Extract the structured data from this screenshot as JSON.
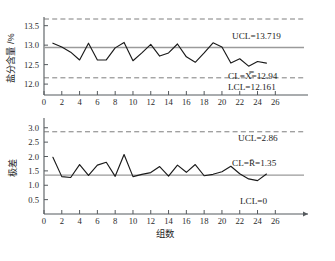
{
  "figure": {
    "background": "#ffffff",
    "line_color": "#1a1a1a",
    "center_line_color": "#9a9a9a",
    "limit_line_color": "#6f6f6f"
  },
  "chart_data": [
    {
      "type": "line",
      "name": "xbar-chart",
      "title": "",
      "xlabel": "",
      "ylabel": "盐分含量 /%",
      "xlim": [
        0,
        27.2
      ],
      "ylim": [
        11.72,
        13.62
      ],
      "grid": false,
      "legend": "none",
      "xticks": [
        0,
        2,
        4,
        6,
        8,
        10,
        12,
        14,
        16,
        18,
        20,
        22,
        24,
        26
      ],
      "xticklabels": [
        "0",
        "2",
        "4",
        "6",
        "8",
        "10",
        "12",
        "14",
        "16",
        "18",
        "20",
        "22",
        "24",
        "26"
      ],
      "yticks": [
        12.0,
        12.5,
        13.0,
        13.5
      ],
      "yticklabels": [
        "12.0",
        "12.5",
        "13.0",
        "13.5"
      ],
      "x": [
        1,
        2,
        3,
        4,
        5,
        6,
        7,
        8,
        9,
        10,
        11,
        12,
        13,
        14,
        15,
        16,
        17,
        18,
        19,
        20,
        21,
        22,
        23,
        24,
        25
      ],
      "values": [
        13.05,
        12.95,
        12.82,
        12.62,
        13.05,
        12.62,
        12.62,
        12.93,
        13.07,
        12.6,
        12.8,
        13.02,
        12.72,
        12.8,
        13.03,
        12.7,
        12.56,
        12.8,
        13.06,
        12.95,
        12.54,
        12.65,
        12.46,
        12.58,
        12.54
      ],
      "control_lines": [
        {
          "label": "UCL",
          "value": 13.719,
          "text": "UCL=13.719",
          "style": "dashed"
        },
        {
          "label": "CL",
          "value": 12.94,
          "text": "CL=X̿=12.94",
          "style": "solid"
        },
        {
          "label": "LCL",
          "value": 12.161,
          "text": "LCL=12.161",
          "style": "dashed"
        }
      ]
    },
    {
      "type": "line",
      "name": "range-chart",
      "title": "",
      "xlabel": "组数",
      "ylabel": "极差",
      "xlim": [
        0,
        27.2
      ],
      "ylim": [
        0,
        3.2
      ],
      "grid": false,
      "legend": "none",
      "xticks": [
        0,
        2,
        4,
        6,
        8,
        10,
        12,
        14,
        16,
        18,
        20,
        22,
        24,
        26
      ],
      "xticklabels": [
        "0",
        "2",
        "4",
        "6",
        "8",
        "10",
        "12",
        "14",
        "16",
        "18",
        "20",
        "22",
        "24",
        "26"
      ],
      "yticks": [
        0.5,
        1.0,
        1.5,
        2.0,
        2.5,
        3.0
      ],
      "yticklabels": [
        "0.5",
        "1.0",
        "1.5",
        "2.0",
        "2.5",
        "3.0"
      ],
      "x": [
        1,
        2,
        3,
        4,
        5,
        6,
        7,
        8,
        9,
        10,
        11,
        12,
        13,
        14,
        15,
        16,
        17,
        18,
        19,
        20,
        21,
        22,
        23,
        24,
        25
      ],
      "values": [
        1.97,
        1.3,
        1.27,
        1.72,
        1.34,
        1.7,
        1.8,
        1.31,
        2.07,
        1.3,
        1.38,
        1.44,
        1.65,
        1.32,
        1.7,
        1.45,
        1.72,
        1.33,
        1.38,
        1.47,
        1.66,
        1.4,
        1.22,
        1.16,
        1.39
      ],
      "control_lines": [
        {
          "label": "UCL",
          "value": 2.86,
          "text": "UCL=2.86",
          "style": "dashed"
        },
        {
          "label": "CL",
          "value": 1.35,
          "text": "CL=R̄=1.35",
          "style": "solid"
        },
        {
          "label": "LCL",
          "value": 0.0,
          "text": "LCL=0",
          "style": "none"
        }
      ]
    }
  ]
}
